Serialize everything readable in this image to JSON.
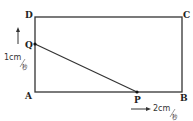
{
  "diagram": {
    "type": "geometry-rectangle-moving-points",
    "vertices": {
      "A": "A",
      "B": "B",
      "C": "C",
      "D": "D"
    },
    "moving_points": {
      "P": {
        "label": "P",
        "side": "AB",
        "direction": "right",
        "speed_value": "2cm",
        "speed_unit": "秒"
      },
      "Q": {
        "label": "Q",
        "side": "AD",
        "direction": "up",
        "speed_value": "1cm",
        "speed_unit": "秒"
      }
    },
    "colors": {
      "line": "#333333",
      "background": "#ffffff"
    }
  }
}
